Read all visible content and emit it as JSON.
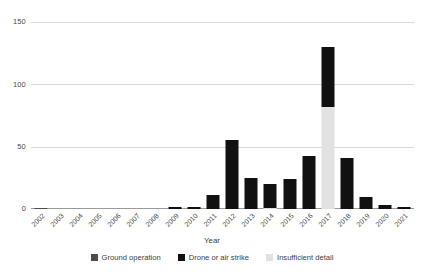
{
  "chart_data": {
    "type": "bar",
    "subtype": "stacked-bar",
    "title": "",
    "xlabel": "Year",
    "ylabel": "",
    "ylim": [
      0,
      150
    ],
    "yticks": [
      0,
      50,
      100,
      150
    ],
    "ytick_labels": [
      "0",
      "50",
      "100",
      "150"
    ],
    "grid": true,
    "legend_position": "bottom",
    "categories": [
      "2002",
      "2003",
      "2004",
      "2005",
      "2006",
      "2007",
      "2008",
      "2009",
      "2010",
      "2011",
      "2012",
      "2013",
      "2014",
      "2015",
      "2016",
      "2017",
      "2018",
      "2019",
      "2020",
      "2021"
    ],
    "series": [
      {
        "name": "Ground operation",
        "color": "#4d4d4d",
        "values": [
          1,
          0,
          0,
          0,
          0,
          0,
          0,
          0,
          0,
          0,
          0,
          0,
          0,
          0,
          0,
          0,
          0,
          0,
          0,
          0
        ]
      },
      {
        "name": "Drone or air strike",
        "color": "#111111",
        "values": [
          0,
          0,
          0,
          0,
          0,
          0,
          0,
          2,
          2,
          11,
          56,
          25,
          19,
          24,
          43,
          49,
          41,
          10,
          3,
          2
        ]
      },
      {
        "name": "Insufficient detail",
        "color": "#e2e2e2",
        "values": [
          0,
          0,
          0,
          0,
          0,
          0,
          0,
          0,
          0,
          0,
          0,
          0,
          1,
          0,
          0,
          82,
          0,
          0,
          0,
          0
        ]
      }
    ],
    "totals": [
      1,
      0,
      0,
      0,
      0,
      0,
      0,
      2,
      2,
      11,
      56,
      25,
      20,
      24,
      43,
      131,
      41,
      10,
      3,
      2
    ]
  },
  "axis": {
    "x_title": "Year",
    "y_tick_labels": [
      "150",
      "100",
      "50",
      "0"
    ]
  },
  "legend": {
    "items": [
      {
        "label": "Ground operation",
        "color": "#4d4d4d"
      },
      {
        "label": "Drone or air strike",
        "color": "#111111"
      },
      {
        "label": "Insufficient detail",
        "color": "#e2e2e2"
      }
    ]
  }
}
